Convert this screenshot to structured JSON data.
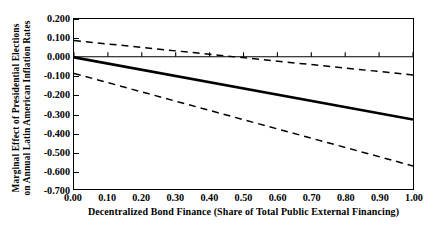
{
  "chart_data": {
    "type": "line",
    "title": "",
    "xlabel": "Decentralized Bond Finance (Share of Total Public External Financing)",
    "ylabel_line1": "Marginal Effect of Presidential Elections",
    "ylabel_line2": "on Annual Latin American Inflation Rates",
    "xlim": [
      0.0,
      1.0
    ],
    "ylim": [
      -0.7,
      0.2
    ],
    "xticks": [
      "0.00",
      "0.10",
      "0.20",
      "0.30",
      "0.40",
      "0.50",
      "0.60",
      "0.70",
      "0.80",
      "0.90",
      "1.00"
    ],
    "xtick_values": [
      0.0,
      0.1,
      0.2,
      0.3,
      0.4,
      0.5,
      0.6,
      0.7,
      0.8,
      0.9,
      1.0
    ],
    "yticks": [
      "0.200",
      "0.100",
      "0.000",
      "-0.100",
      "-0.200",
      "-0.300",
      "-0.400",
      "-0.500",
      "-0.600",
      "-0.700"
    ],
    "ytick_values": [
      0.2,
      0.1,
      0.0,
      -0.1,
      -0.2,
      -0.3,
      -0.4,
      -0.5,
      -0.6,
      -0.7
    ],
    "grid": false,
    "legend": "none",
    "zero_reference_line": {
      "y": 0.0,
      "style": "solid",
      "has_ticks": true,
      "tick_values": [
        0.0,
        0.1,
        0.2,
        0.3,
        0.4,
        0.5,
        0.6,
        0.7,
        0.8,
        0.9,
        1.0
      ]
    },
    "series": [
      {
        "name": "Marginal effect (point estimate)",
        "style": "solid",
        "width": 2.6,
        "color": "#000000",
        "x": [
          0.0,
          1.0
        ],
        "values": [
          -0.003,
          -0.332
        ]
      },
      {
        "name": "Upper 95% confidence bound",
        "style": "dashed",
        "width": 1.5,
        "color": "#000000",
        "x": [
          0.0,
          1.0
        ],
        "values": [
          0.086,
          -0.096
        ]
      },
      {
        "name": "Lower 95% confidence bound",
        "style": "dashed",
        "width": 1.5,
        "color": "#000000",
        "x": [
          0.0,
          1.0
        ],
        "values": [
          -0.088,
          -0.578
        ]
      }
    ]
  },
  "colors": {
    "line": "#000000",
    "frame": "#000000",
    "background": "#ffffff"
  }
}
